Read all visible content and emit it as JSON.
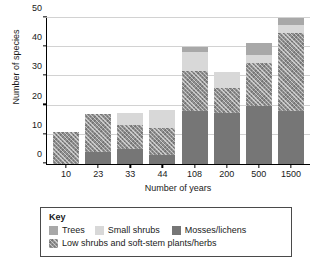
{
  "chart_data": {
    "type": "bar",
    "subtype": "stacked",
    "title": "",
    "xlabel": "Number of years",
    "ylabel": "Number of species",
    "categories": [
      "10",
      "23",
      "33",
      "44",
      "108",
      "200",
      "500",
      "1500"
    ],
    "ylim": [
      0,
      50
    ],
    "yticks": [
      0,
      10,
      20,
      30,
      40,
      50
    ],
    "grid": true,
    "legend_position": "below-plot",
    "legend_title": "Key",
    "series": [
      {
        "name": "Mosses/lichens",
        "color": "#767676",
        "values": [
          0,
          4,
          5,
          3,
          18,
          17.5,
          20,
          18
        ]
      },
      {
        "name": "Low shrubs and soft-stem plants/herbs",
        "color": "#8f8f8f",
        "pattern": "cross-hatch",
        "values": [
          11,
          13,
          8.5,
          9.5,
          14,
          8.5,
          14.5,
          27
        ]
      },
      {
        "name": "Small shrubs",
        "color": "#d8d8d8",
        "values": [
          0,
          0,
          4,
          6,
          6.5,
          5.5,
          3,
          2.5
        ]
      },
      {
        "name": "Trees",
        "color": "#a8a8a8",
        "values": [
          0,
          0,
          0,
          0,
          1.5,
          0,
          4,
          2.5
        ]
      }
    ],
    "totals": [
      11,
      17,
      17.5,
      18.5,
      40,
      31.5,
      41.5,
      50
    ]
  },
  "legend": {
    "title": "Key",
    "entries": [
      {
        "label": "Trees",
        "swatch": "trees-swatch"
      },
      {
        "label": "Small shrubs",
        "swatch": "small-shrubs-swatch"
      },
      {
        "label": "Mosses/lichens",
        "swatch": "mosses-lichens-swatch"
      },
      {
        "label": "Low shrubs and soft-stem plants/herbs",
        "swatch": "low-shrubs-swatch"
      }
    ]
  }
}
